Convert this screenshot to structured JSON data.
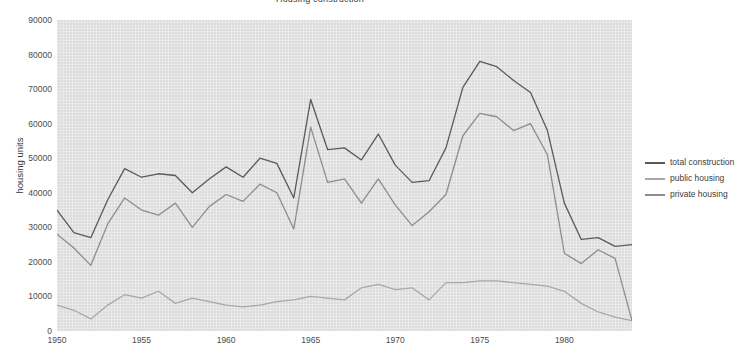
{
  "chart_data": {
    "type": "line",
    "title": "Housing construction",
    "xlabel": "",
    "ylabel": "housing units",
    "xlim": [
      1950,
      1984
    ],
    "ylim": [
      0,
      90000
    ],
    "grid": false,
    "legend_position": "right",
    "x": [
      1950,
      1951,
      1952,
      1953,
      1954,
      1955,
      1956,
      1957,
      1958,
      1959,
      1960,
      1961,
      1962,
      1963,
      1964,
      1965,
      1966,
      1967,
      1968,
      1969,
      1970,
      1971,
      1972,
      1973,
      1974,
      1975,
      1976,
      1977,
      1978,
      1979,
      1980,
      1981,
      1982,
      1983,
      1984
    ],
    "xticks": [
      "1950",
      "1955",
      "1960",
      "1965",
      "1970",
      "1975",
      "1980"
    ],
    "xtick_values": [
      1950,
      1955,
      1960,
      1965,
      1970,
      1975,
      1980
    ],
    "yticks": [
      "0",
      "10000",
      "20000",
      "30000",
      "40000",
      "50000",
      "60000",
      "70000",
      "80000",
      "90000"
    ],
    "ytick_values": [
      0,
      10000,
      20000,
      30000,
      40000,
      50000,
      60000,
      70000,
      80000,
      90000
    ],
    "series": [
      {
        "name": "total construction",
        "color": "#5a5a5a",
        "values": [
          35000,
          28500,
          27000,
          38000,
          47000,
          44500,
          45500,
          45000,
          40000,
          44000,
          47500,
          44500,
          50000,
          48500,
          38500,
          67000,
          52500,
          53000,
          49500,
          57000,
          48000,
          43000,
          43500,
          53000,
          70500,
          78000,
          76500,
          72500,
          69000,
          58000,
          37000,
          26500,
          27000,
          24500,
          25000
        ]
      },
      {
        "name": "public housing",
        "color": "#a8a8a8",
        "values": [
          7500,
          6000,
          3500,
          7500,
          10500,
          9500,
          11500,
          8000,
          9500,
          8500,
          7500,
          7000,
          7500,
          8500,
          9000,
          10000,
          9500,
          9000,
          12500,
          13500,
          12000,
          12500,
          9000,
          14000,
          14000,
          14500,
          14500,
          14000,
          13500,
          13000,
          11500,
          8000,
          5500,
          4000,
          3000
        ]
      },
      {
        "name": "private housing",
        "color": "#8d8d8d",
        "values": [
          28000,
          24000,
          19000,
          31000,
          38500,
          35000,
          33500,
          37000,
          30000,
          36000,
          39500,
          37500,
          42500,
          40000,
          29500,
          59000,
          43000,
          44000,
          37000,
          44000,
          36500,
          30500,
          34500,
          39500,
          56500,
          63000,
          62000,
          58000,
          60000,
          51000,
          22500,
          19500,
          23500,
          21000,
          3000
        ]
      }
    ]
  },
  "legend": {
    "items": [
      {
        "label": "total construction",
        "color": "#5a5a5a"
      },
      {
        "label": "public housing",
        "color": "#a8a8a8"
      },
      {
        "label": "private housing",
        "color": "#8d8d8d"
      }
    ]
  },
  "axes": {
    "y_axis_title": "housing units"
  }
}
